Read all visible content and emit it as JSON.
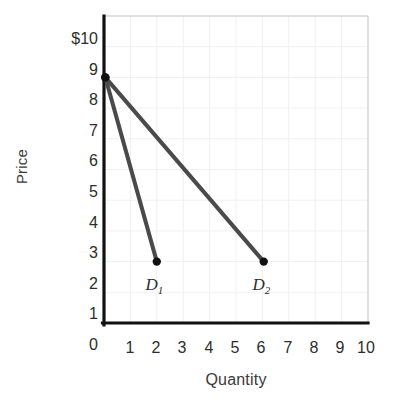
{
  "chart_data": {
    "type": "line",
    "title": "",
    "subtitle": "",
    "xlabel": "Quantity",
    "ylabel": "Price",
    "xlim": [
      0,
      10
    ],
    "ylim": [
      0,
      10
    ],
    "xticks": [
      "1",
      "2",
      "3",
      "4",
      "5",
      "6",
      "7",
      "8",
      "9",
      "10"
    ],
    "yticks": [
      "$10",
      "9",
      "8",
      "7",
      "6",
      "5",
      "4",
      "3",
      "2",
      "1",
      "0"
    ],
    "ytick_values": [
      10,
      9,
      8,
      7,
      6,
      5,
      4,
      3,
      2,
      1,
      0
    ],
    "xtick_values": [
      1,
      2,
      3,
      4,
      5,
      6,
      7,
      8,
      9,
      10
    ],
    "grid": true,
    "legend_position": "inline-annotation",
    "series": [
      {
        "name": "D1",
        "label": "D",
        "subscript": "1",
        "color": "#4a4a4a",
        "points": [
          {
            "x": 0.05,
            "y": 8
          },
          {
            "x": 2.0,
            "y": 2
          }
        ],
        "markers": [
          {
            "x": 0.05,
            "y": 8
          },
          {
            "x": 2.0,
            "y": 2
          }
        ],
        "annotation": {
          "x": 1.95,
          "y": 1.25
        }
      },
      {
        "name": "D2",
        "label": "D",
        "subscript": "2",
        "color": "#4a4a4a",
        "points": [
          {
            "x": 0.05,
            "y": 8
          },
          {
            "x": 6.05,
            "y": 2
          }
        ],
        "markers": [
          {
            "x": 0.05,
            "y": 8
          },
          {
            "x": 6.05,
            "y": 2
          }
        ],
        "annotation": {
          "x": 6.0,
          "y": 1.25
        }
      }
    ],
    "colors": {
      "line": "#4a4a4a",
      "marker": "#111111",
      "axis": "#111111",
      "grid": "#f0f0f0",
      "tick_text": "#2d2d2d",
      "axis_title": "#3a3a3a",
      "background": "#ffffff"
    }
  }
}
